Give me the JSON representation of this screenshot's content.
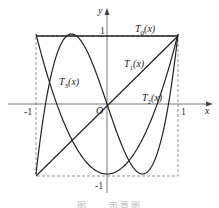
{
  "chart_data": {
    "type": "line",
    "title": "",
    "caption": "图 … 示意图",
    "xlabel": "x",
    "ylabel": "y",
    "origin_label": "O",
    "xlim": [
      -1,
      1
    ],
    "ylim": [
      -1,
      1
    ],
    "x_ticks": [
      "-1",
      "1"
    ],
    "y_ticks": [
      "1",
      "-1"
    ],
    "grid": false,
    "bounding_box": "dashed square [-1,1]x[-1,1]",
    "series": [
      {
        "name": "T0(x)",
        "formula": "1",
        "x": [
          -1,
          1
        ],
        "values": [
          1,
          1
        ]
      },
      {
        "name": "T1(x)",
        "formula": "x",
        "x": [
          -1,
          1
        ],
        "values": [
          -1,
          1
        ]
      },
      {
        "name": "T2(x)",
        "formula": "2x^2 - 1",
        "x": [
          -1,
          -0.5,
          0,
          0.5,
          1
        ],
        "values": [
          1,
          -0.5,
          -1,
          -0.5,
          1
        ]
      },
      {
        "name": "T3(x)",
        "formula": "4x^3 - 3x",
        "x": [
          -1,
          -0.5,
          0,
          0.5,
          1
        ],
        "values": [
          -1,
          1,
          0,
          -1,
          1
        ]
      }
    ],
    "annotations": [
      {
        "text": "T0(x)",
        "near": "top edge, right of y-axis"
      },
      {
        "text": "T1(x)",
        "near": "upper right, along diagonal"
      },
      {
        "text": "T2(x)",
        "near": "right side, above x-axis"
      },
      {
        "text": "T3(x)",
        "near": "left side, above x-axis"
      }
    ]
  },
  "labels": {
    "y_axis": "y",
    "x_axis": "x",
    "origin": "O",
    "y_one": "1",
    "y_neg_one": "-1",
    "x_one": "1",
    "x_neg_one": "-1",
    "t0": "T",
    "t0_sub": "0",
    "t1": "T",
    "t1_sub": "1",
    "t2": "T",
    "t2_sub": "2",
    "t3": "T",
    "t3_sub": "3",
    "arg": "(x)",
    "caption": "图 … 示意图"
  }
}
